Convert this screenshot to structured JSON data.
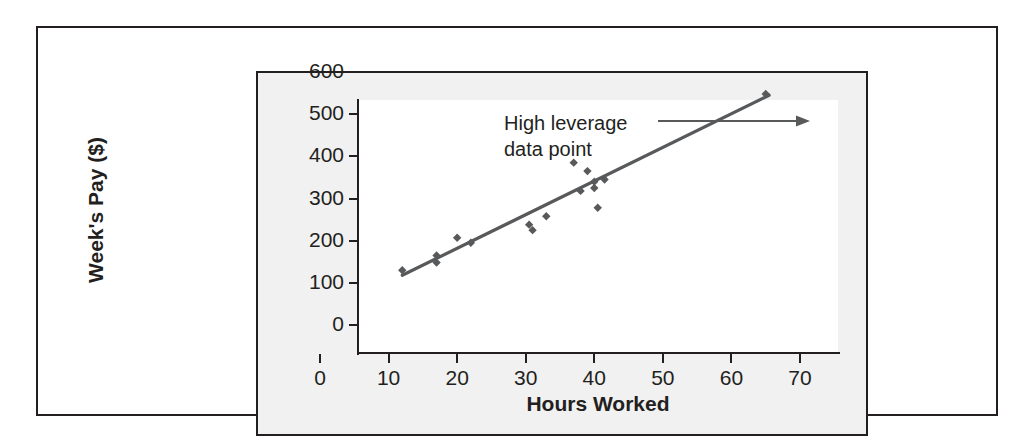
{
  "figure": {
    "frame_color": "#231f20",
    "panel_background": "#f1f1f1",
    "plot_background": "#ffffff"
  },
  "annotation": {
    "line1": "High leverage",
    "line2": "data point",
    "arrow": "arrow-right"
  },
  "chart_data": {
    "type": "scatter",
    "title": "",
    "xlabel": "Hours Worked",
    "ylabel": "Week's Pay ($)",
    "xlim": [
      0,
      70
    ],
    "ylim": [
      0,
      600
    ],
    "xticks": [
      0,
      10,
      20,
      30,
      40,
      50,
      60,
      70
    ],
    "yticks": [
      0,
      100,
      200,
      300,
      400,
      500,
      600
    ],
    "grid": false,
    "legend": null,
    "point_color": "#58595b",
    "line_color": "#58595b",
    "points": [
      {
        "x": 12,
        "y": 130
      },
      {
        "x": 17,
        "y": 148
      },
      {
        "x": 17,
        "y": 165
      },
      {
        "x": 20,
        "y": 207
      },
      {
        "x": 22,
        "y": 195
      },
      {
        "x": 30.5,
        "y": 238
      },
      {
        "x": 31,
        "y": 225
      },
      {
        "x": 33,
        "y": 258
      },
      {
        "x": 37,
        "y": 385
      },
      {
        "x": 38,
        "y": 318
      },
      {
        "x": 39,
        "y": 365
      },
      {
        "x": 40,
        "y": 340
      },
      {
        "x": 40,
        "y": 325
      },
      {
        "x": 40.5,
        "y": 278
      },
      {
        "x": 41.5,
        "y": 345
      },
      {
        "x": 65,
        "y": 548
      }
    ],
    "regression_line": {
      "x_start": 12,
      "y_start": 118,
      "x_end": 65.5,
      "y_end": 545
    },
    "annotations": [
      {
        "text": "High leverage data point",
        "target_x": 65,
        "target_y": 548
      }
    ]
  },
  "axes": {
    "y_tick_labels": [
      "600",
      "500",
      "400",
      "300",
      "200",
      "100",
      "0"
    ],
    "x_tick_labels": [
      "0",
      "10",
      "20",
      "30",
      "40",
      "50",
      "60",
      "70"
    ]
  }
}
